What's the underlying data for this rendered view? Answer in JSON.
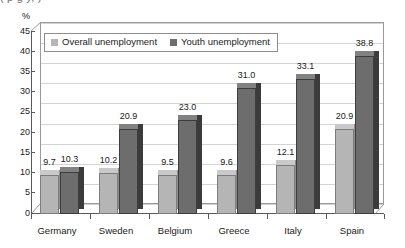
{
  "top_remnant": "( p g y, )",
  "chart_data": {
    "type": "bar",
    "title": "",
    "xlabel": "",
    "ylabel": "%",
    "unit_label": "%",
    "categories": [
      "Germany",
      "Sweden",
      "Belgium",
      "Greece",
      "Italy",
      "Spain"
    ],
    "series": [
      {
        "name": "Overall unemployment",
        "color": "#b5b5b5",
        "values": [
          9.7,
          10.2,
          9.5,
          9.6,
          12.1,
          20.9
        ],
        "labels": [
          "9.7",
          "10.2",
          "9.5",
          "9.6",
          "12.1",
          "20.9"
        ]
      },
      {
        "name": "Youth unemployment",
        "color": "#6d6d6d",
        "values": [
          10.3,
          20.9,
          23.0,
          31.0,
          33.1,
          38.8
        ],
        "labels": [
          "10.3",
          "20.9",
          "23.0",
          "31.0",
          "33.1",
          "38.8"
        ]
      }
    ],
    "ylim": [
      0,
      45
    ],
    "yticks": [
      0,
      5,
      10,
      15,
      20,
      25,
      30,
      35,
      40,
      45
    ],
    "ytick_labels": [
      "0",
      "5",
      "10",
      "15",
      "20",
      "25",
      "30",
      "35",
      "40",
      "45"
    ],
    "grid": true,
    "legend_position": "top-left",
    "style": "3d-column"
  }
}
